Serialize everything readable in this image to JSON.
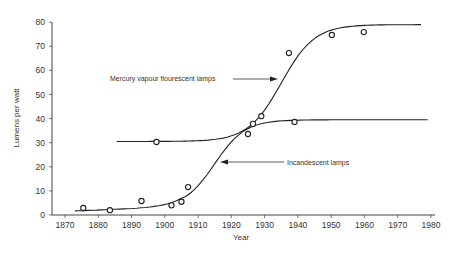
{
  "chart_data": {
    "type": "scatter",
    "title": "",
    "xlabel": "Year",
    "ylabel": "Lumens per watt",
    "xlim": [
      1865,
      1982
    ],
    "ylim": [
      0,
      80
    ],
    "xticks": [
      1870,
      1880,
      1890,
      1900,
      1910,
      1920,
      1930,
      1940,
      1950,
      1960,
      1970,
      1980
    ],
    "yticks": [
      0,
      10,
      20,
      30,
      40,
      50,
      60,
      70,
      80
    ],
    "grid": false,
    "legend": null,
    "series": [
      {
        "name": "Incandescent lamps",
        "points": [
          {
            "x": 1875.5,
            "y": 2.9
          },
          {
            "x": 1883.5,
            "y": 2.0
          },
          {
            "x": 1893,
            "y": 5.8
          },
          {
            "x": 1902,
            "y": 4.0
          },
          {
            "x": 1905,
            "y": 5.5
          },
          {
            "x": 1907,
            "y": 11.6
          },
          {
            "x": 1925,
            "y": 33.6
          },
          {
            "x": 1926.5,
            "y": 37.8
          },
          {
            "x": 1929,
            "y": 41.0
          },
          {
            "x": 1939,
            "y": 38.6
          }
        ],
        "trend_curve": {
          "shape": "sigmoid",
          "start": {
            "x": 1873,
            "y": 1.6
          },
          "end": {
            "x": 1979,
            "y": 39.4
          },
          "lower_plateau": 3,
          "upper_plateau": 39.5,
          "midpoint_year": 1915
        }
      },
      {
        "name": "Mercury vapour flourescent lamps",
        "points": [
          {
            "x": 1897.5,
            "y": 30.3
          },
          {
            "x": 1937.3,
            "y": 67.2
          },
          {
            "x": 1950.2,
            "y": 74.7
          },
          {
            "x": 1959.8,
            "y": 75.9
          }
        ],
        "trend_curve": {
          "shape": "sigmoid",
          "start": {
            "x": 1885.5,
            "y": 30.5
          },
          "end": {
            "x": 1977,
            "y": 79.0
          },
          "lower_plateau": 30.5,
          "upper_plateau": 79,
          "midpoint_year": 1935
        }
      }
    ],
    "annotations": [
      {
        "text": "Mercury vapour flourescent lamps",
        "arrow_to": {
          "x": 1932.5,
          "y": 55
        }
      },
      {
        "text": "Incandescent lamps",
        "arrow_to": {
          "x": 1915,
          "y": 22.5
        }
      }
    ]
  }
}
